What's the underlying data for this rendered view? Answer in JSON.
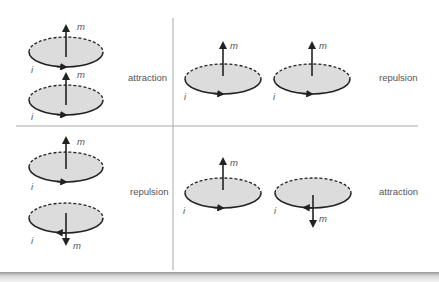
{
  "figure": {
    "symbols": {
      "moment": "m",
      "current": "i"
    },
    "colors": {
      "disk_fill": "#dcdcdc",
      "stroke": "#222222",
      "divider": "#aaaaaa",
      "label": "#555555"
    },
    "panels": [
      {
        "id": "top-left",
        "arrangement": "coaxial-stacked",
        "moments": [
          "up",
          "up"
        ],
        "currents": [
          "counterclockwise",
          "counterclockwise"
        ],
        "result": "attraction"
      },
      {
        "id": "top-right",
        "arrangement": "side-by-side",
        "moments": [
          "up",
          "up"
        ],
        "currents": [
          "counterclockwise",
          "counterclockwise"
        ],
        "result": "repulsion"
      },
      {
        "id": "bottom-left",
        "arrangement": "coaxial-stacked",
        "moments": [
          "up",
          "down"
        ],
        "currents": [
          "counterclockwise",
          "clockwise"
        ],
        "result": "repulsion"
      },
      {
        "id": "bottom-right",
        "arrangement": "side-by-side",
        "moments": [
          "up",
          "down"
        ],
        "currents": [
          "counterclockwise",
          "clockwise"
        ],
        "result": "attraction"
      }
    ]
  }
}
